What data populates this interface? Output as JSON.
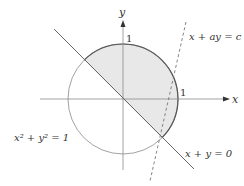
{
  "figure": {
    "axes": {
      "x_label": "x",
      "y_label": "y",
      "x_tick": "1",
      "y_tick": "1"
    },
    "curves": {
      "circle": {
        "equation": "x² + y² = 1",
        "style": "solid"
      },
      "line_diagonal": {
        "equation": "x + y = 0",
        "style": "solid"
      },
      "line_dashed": {
        "equation": "x + ay = c",
        "style": "dashed"
      }
    },
    "shaded_region": {
      "description": "half-disk of unit circle where x + y ≥ 0",
      "fill_color": "#e8e8e8"
    },
    "colors": {
      "axis": "#888888",
      "circle_thin": "#888888",
      "boundary_bold": "#555555",
      "dashed": "#777777"
    }
  }
}
